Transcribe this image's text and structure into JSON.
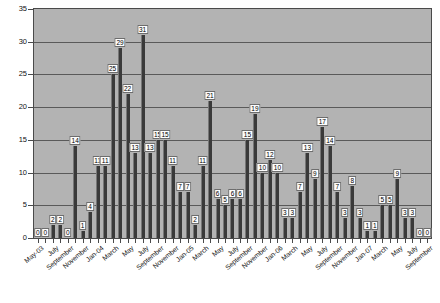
{
  "chart_data": {
    "type": "bar",
    "title": "",
    "subtitle": "",
    "xlabel": "",
    "ylabel": "",
    "ylim": [
      0,
      35
    ],
    "ytick_step": 5,
    "yticks": [
      0,
      5,
      10,
      15,
      20,
      25,
      30,
      35
    ],
    "grid": true,
    "grid_orientation": "horizontal",
    "legend": null,
    "legend_position": "none",
    "data_labels": true,
    "plot_background": "#b3b3b3",
    "bar_color": "#3a3a3a",
    "xtick_label_interval": 2,
    "xtick_label_rotation": -40,
    "categories": [
      "May-03",
      "June",
      "July",
      "August",
      "September",
      "October",
      "November",
      "December",
      "Jan-04",
      "February",
      "March",
      "April",
      "May",
      "June",
      "July",
      "August",
      "September",
      "October",
      "November",
      "December",
      "Jan-05",
      "February",
      "March",
      "April",
      "May",
      "June",
      "July",
      "August",
      "September",
      "October",
      "November",
      "December",
      "Jan-06",
      "February",
      "March",
      "April",
      "May",
      "June",
      "July",
      "August",
      "September",
      "October",
      "November",
      "December",
      "Jan-07",
      "February",
      "March",
      "April",
      "May",
      "June",
      "July",
      "August",
      "September"
    ],
    "xtick_labels": [
      "May-03",
      "July",
      "September",
      "November",
      "Jan-04",
      "March",
      "May",
      "July",
      "September",
      "November",
      "Jan-05",
      "March",
      "May",
      "July",
      "September",
      "November",
      "Jan-06",
      "March",
      "May",
      "July",
      "September",
      "November",
      "Jan-07",
      "March",
      "May",
      "July",
      "September"
    ],
    "values": [
      0,
      0,
      2,
      2,
      0,
      14,
      1,
      4,
      11,
      11,
      25,
      29,
      22,
      13,
      31,
      13,
      15,
      15,
      11,
      7,
      7,
      2,
      11,
      21,
      6,
      5,
      6,
      6,
      15,
      19,
      10,
      12,
      10,
      3,
      3,
      7,
      13,
      9,
      17,
      14,
      7,
      3,
      8,
      3,
      1,
      1,
      5,
      5,
      9,
      3,
      3,
      0,
      0
    ]
  },
  "caption": {
    "text": ""
  }
}
